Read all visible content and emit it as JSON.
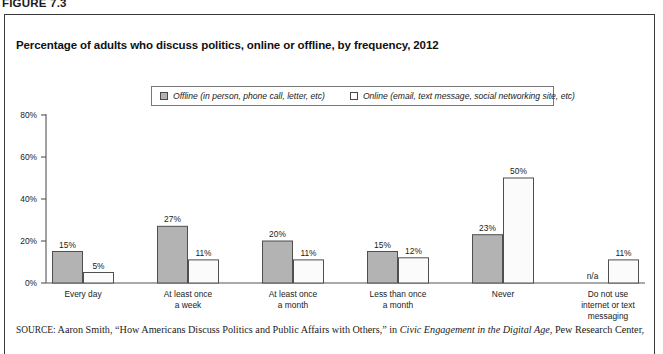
{
  "figure": {
    "number_label": "FIGURE 7.3",
    "title": "Percentage of adults who discuss politics, online or offline, by frequency, 2012"
  },
  "legend": {
    "offline_label": "Offline (in person, phone call, letter, etc)",
    "online_label": "Online (email, text message, social networking site, etc)"
  },
  "source": {
    "kicker": "SOURCE:",
    "text_before_italic": " Aaron Smith, “How Americans Discuss Politics and Public Affairs with Others,” in ",
    "italic_title": "Civic Engagement in the Digital Age",
    "text_after_italic": ", Pew Research Center,"
  },
  "chart_data": {
    "type": "bar",
    "title": "Percentage of adults who discuss politics, online or offline, by frequency, 2012",
    "xlabel": "",
    "ylabel": "",
    "ylim": [
      0,
      80
    ],
    "ytick_labels": [
      "0%",
      "20%",
      "40%",
      "60%",
      "80%"
    ],
    "ytick_values": [
      0,
      20,
      40,
      60,
      80
    ],
    "grid": false,
    "legend_position": "top-center",
    "categories": [
      "Every day",
      "At least once a week",
      "At least once a month",
      "Less than once a month",
      "Never",
      "Do not use internet or text messaging"
    ],
    "category_lines": [
      [
        "Every day"
      ],
      [
        "At least once",
        "a week"
      ],
      [
        "At least once",
        "a month"
      ],
      [
        "Less than once",
        "a month"
      ],
      [
        "Never"
      ],
      [
        "Do not use",
        "internet or text",
        "messaging"
      ]
    ],
    "series": [
      {
        "name": "Offline (in person, phone call, letter, etc)",
        "color": "#b3b3b3",
        "values": [
          15,
          27,
          20,
          15,
          23,
          null
        ],
        "labels": [
          "15%",
          "27%",
          "20%",
          "15%",
          "23%",
          "n/a"
        ]
      },
      {
        "name": "Online (email, text message, social networking site, etc)",
        "color": "#ffffff",
        "values": [
          5,
          11,
          11,
          12,
          50,
          11
        ],
        "labels": [
          "5%",
          "11%",
          "11%",
          "12%",
          "50%",
          "11%"
        ]
      }
    ]
  }
}
